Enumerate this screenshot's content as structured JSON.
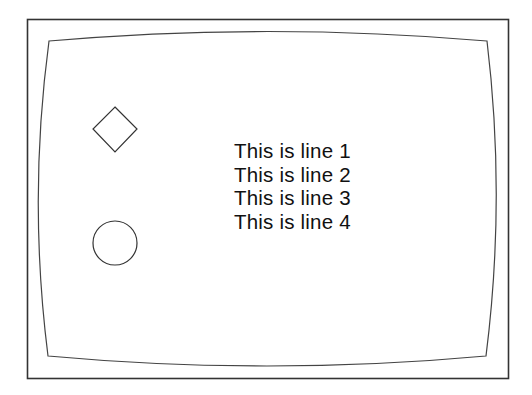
{
  "screen": {
    "frame_color": "#333333",
    "background": "#ffffff"
  },
  "shapes": [
    {
      "type": "diamond",
      "name": "diamond-shape"
    },
    {
      "type": "circle",
      "name": "circle-shape"
    }
  ],
  "text": {
    "lines": [
      "This is line 1",
      "This is line 2",
      "This is line 3",
      "This is line 4"
    ]
  }
}
